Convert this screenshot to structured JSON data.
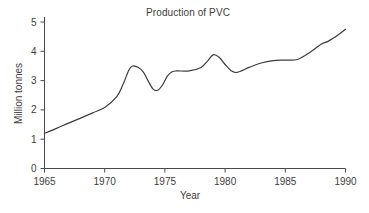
{
  "chart_data": {
    "type": "line",
    "title": "Production of PVC",
    "xlabel": "Year",
    "ylabel": "Million tonnes",
    "xlim": [
      1965,
      1990
    ],
    "ylim": [
      0,
      5
    ],
    "xticks": [
      1965,
      1970,
      1975,
      1980,
      1985,
      1990
    ],
    "yticks": [
      0,
      1,
      2,
      3,
      4,
      5
    ],
    "grid": false,
    "legend": null,
    "line_color": "#3c3c3c",
    "series": [
      {
        "name": "Production of PVC",
        "x": [
          1965,
          1966,
          1967,
          1968,
          1969,
          1970,
          1971,
          1971.5,
          1972,
          1972.3,
          1972.8,
          1973.2,
          1973.6,
          1974,
          1974.4,
          1974.8,
          1975.2,
          1975.6,
          1976,
          1977,
          1978,
          1978.5,
          1979,
          1979.5,
          1980,
          1980.5,
          1981,
          1982,
          1983,
          1984,
          1985,
          1986,
          1987,
          1988,
          1988.5,
          1989,
          1990
        ],
        "y": [
          1.2,
          1.37,
          1.55,
          1.72,
          1.9,
          2.08,
          2.45,
          2.85,
          3.35,
          3.5,
          3.45,
          3.3,
          3.0,
          2.72,
          2.67,
          2.85,
          3.15,
          3.3,
          3.33,
          3.33,
          3.45,
          3.65,
          3.88,
          3.8,
          3.55,
          3.34,
          3.28,
          3.45,
          3.6,
          3.68,
          3.7,
          3.72,
          3.95,
          4.25,
          4.33,
          4.45,
          4.75
        ]
      }
    ]
  },
  "axis": {
    "x_tick_labels": [
      "1965",
      "1970",
      "1975",
      "1980",
      "1985",
      "1990"
    ],
    "y_tick_labels": [
      "0",
      "1",
      "2",
      "3",
      "4",
      "5"
    ]
  }
}
